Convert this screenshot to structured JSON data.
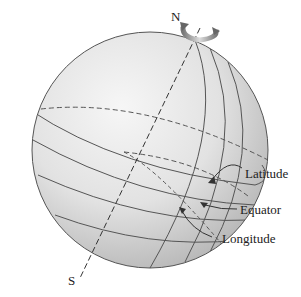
{
  "diagram": {
    "type": "globe-coordinates",
    "labels": {
      "north": "N",
      "south": "S",
      "latitude": "Latitude",
      "equator": "Equator",
      "longitude": "Longitude"
    },
    "icons": {
      "rotation": "rotation-arrow-icon"
    },
    "colors": {
      "sphere_light": "#f4f4f4",
      "sphere_dark": "#b9b9b9",
      "line": "#555555",
      "text": "#222222"
    }
  }
}
